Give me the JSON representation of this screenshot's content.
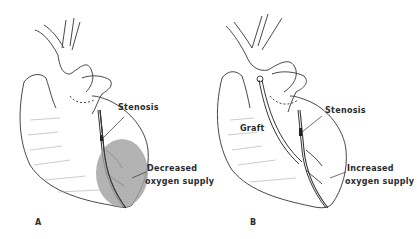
{
  "figure": {
    "panels": [
      {
        "id": "A",
        "panel_label": "A",
        "labels": {
          "stenosis": "Stenosis",
          "effect_line1": "Decreased",
          "effect_line2": "oxygen supply"
        }
      },
      {
        "id": "B",
        "panel_label": "B",
        "labels": {
          "graft": "Graft",
          "stenosis": "Stenosis",
          "effect_line1": "Increased",
          "effect_line2": "oxygen supply"
        }
      }
    ],
    "colors": {
      "line": "#333333",
      "ischemic_shade": "#9a9a9a",
      "background": "#ffffff"
    }
  }
}
